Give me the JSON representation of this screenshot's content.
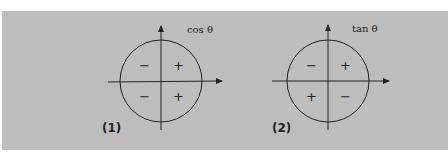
{
  "figure": {
    "background_color": "#bdbdbd",
    "line_color": "#222222",
    "diagrams": [
      {
        "id": "1",
        "number_label": "(1)",
        "function_label": "cos θ",
        "quadrant_signs": {
          "q1": "+",
          "q2": "−",
          "q3": "−",
          "q4": "+"
        }
      },
      {
        "id": "2",
        "number_label": "(2)",
        "function_label": "tan θ",
        "quadrant_signs": {
          "q1": "+",
          "q2": "−",
          "q3": "+",
          "q4": "−"
        }
      }
    ]
  }
}
